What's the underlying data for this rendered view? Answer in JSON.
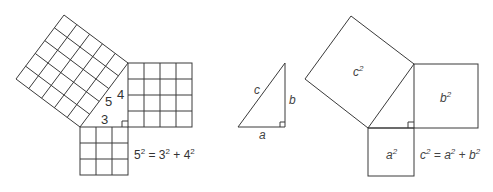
{
  "left_figure": {
    "labels": {
      "hyp": "5",
      "leg_vertical": "4",
      "leg_horizontal": "3"
    },
    "equation": {
      "base1": "5",
      "exp1": "2",
      "eq": " = ",
      "base2": "3",
      "exp2": "2",
      "plus": " + ",
      "base3": "4",
      "exp3": "2"
    },
    "grids": {
      "hyp_square": 5,
      "vertical_square": 4,
      "horizontal_square": 3
    }
  },
  "middle_figure": {
    "labels": {
      "hyp": "c",
      "vertical": "b",
      "horizontal": "a"
    }
  },
  "right_figure": {
    "square_labels": {
      "hyp": "c",
      "vertical": "b",
      "horizontal": "a",
      "exp": "2"
    },
    "equation": {
      "lhs": "c",
      "exp1": "2",
      "eq": " = ",
      "t1": "a",
      "exp2": "2",
      "plus": " + ",
      "t2": "b",
      "exp3": "2"
    }
  }
}
